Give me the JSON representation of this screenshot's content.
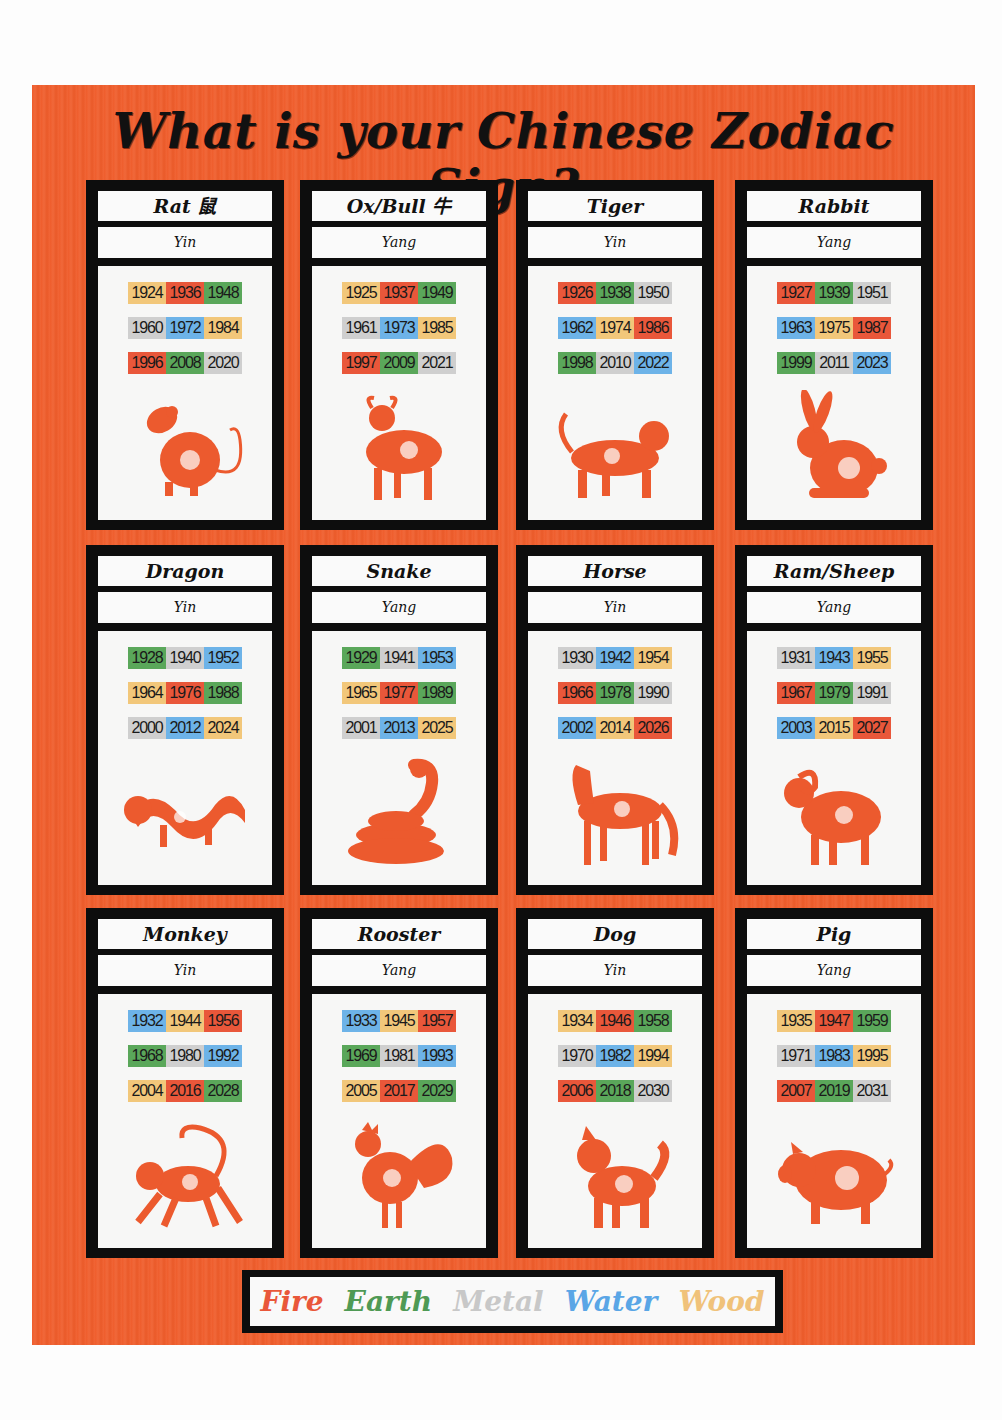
{
  "title": "What is your Chinese Zodiac Sign?",
  "colors": {
    "fire": "#e9573a",
    "earth": "#5aa75a",
    "metal": "#cfcfcf",
    "water": "#6db3e8",
    "wood": "#f2c77a",
    "poster_background": "#ef5d2c"
  },
  "legend": [
    {
      "label": "Fire",
      "element": "fire",
      "color": "#e9573a"
    },
    {
      "label": "Earth",
      "element": "earth",
      "color": "#4f9a55"
    },
    {
      "label": "Metal",
      "element": "metal",
      "color": "#c8c8c8"
    },
    {
      "label": "Water",
      "element": "water",
      "color": "#5aa6e6"
    },
    {
      "label": "Wood",
      "element": "wood",
      "color": "#f0c27a"
    }
  ],
  "signs": [
    {
      "name": "Rat 鼠",
      "polarity": "Yin",
      "icon": "rat-icon",
      "years": [
        [
          [
            "1924",
            "wood"
          ],
          [
            "1936",
            "fire"
          ],
          [
            "1948",
            "earth"
          ]
        ],
        [
          [
            "1960",
            "metal"
          ],
          [
            "1972",
            "water"
          ],
          [
            "1984",
            "wood"
          ]
        ],
        [
          [
            "1996",
            "fire"
          ],
          [
            "2008",
            "earth"
          ],
          [
            "2020",
            "metal"
          ]
        ]
      ]
    },
    {
      "name": "Ox/Bull 牛",
      "polarity": "Yang",
      "icon": "ox-icon",
      "years": [
        [
          [
            "1925",
            "wood"
          ],
          [
            "1937",
            "fire"
          ],
          [
            "1949",
            "earth"
          ]
        ],
        [
          [
            "1961",
            "metal"
          ],
          [
            "1973",
            "water"
          ],
          [
            "1985",
            "wood"
          ]
        ],
        [
          [
            "1997",
            "fire"
          ],
          [
            "2009",
            "earth"
          ],
          [
            "2021",
            "metal"
          ]
        ]
      ]
    },
    {
      "name": "Tiger",
      "polarity": "Yin",
      "icon": "tiger-icon",
      "years": [
        [
          [
            "1926",
            "fire"
          ],
          [
            "1938",
            "earth"
          ],
          [
            "1950",
            "metal"
          ]
        ],
        [
          [
            "1962",
            "water"
          ],
          [
            "1974",
            "wood"
          ],
          [
            "1986",
            "fire"
          ]
        ],
        [
          [
            "1998",
            "earth"
          ],
          [
            "2010",
            "metal"
          ],
          [
            "2022",
            "water"
          ]
        ]
      ]
    },
    {
      "name": "Rabbit",
      "polarity": "Yang",
      "icon": "rabbit-icon",
      "years": [
        [
          [
            "1927",
            "fire"
          ],
          [
            "1939",
            "earth"
          ],
          [
            "1951",
            "metal"
          ]
        ],
        [
          [
            "1963",
            "water"
          ],
          [
            "1975",
            "wood"
          ],
          [
            "1987",
            "fire"
          ]
        ],
        [
          [
            "1999",
            "earth"
          ],
          [
            "2011",
            "metal"
          ],
          [
            "2023",
            "water"
          ]
        ]
      ]
    },
    {
      "name": "Dragon",
      "polarity": "Yin",
      "icon": "dragon-icon",
      "years": [
        [
          [
            "1928",
            "earth"
          ],
          [
            "1940",
            "metal"
          ],
          [
            "1952",
            "water"
          ]
        ],
        [
          [
            "1964",
            "wood"
          ],
          [
            "1976",
            "fire"
          ],
          [
            "1988",
            "earth"
          ]
        ],
        [
          [
            "2000",
            "metal"
          ],
          [
            "2012",
            "water"
          ],
          [
            "2024",
            "wood"
          ]
        ]
      ]
    },
    {
      "name": "Snake",
      "polarity": "Yang",
      "icon": "snake-icon",
      "years": [
        [
          [
            "1929",
            "earth"
          ],
          [
            "1941",
            "metal"
          ],
          [
            "1953",
            "water"
          ]
        ],
        [
          [
            "1965",
            "wood"
          ],
          [
            "1977",
            "fire"
          ],
          [
            "1989",
            "earth"
          ]
        ],
        [
          [
            "2001",
            "metal"
          ],
          [
            "2013",
            "water"
          ],
          [
            "2025",
            "wood"
          ]
        ]
      ]
    },
    {
      "name": "Horse",
      "polarity": "Yin",
      "icon": "horse-icon",
      "years": [
        [
          [
            "1930",
            "metal"
          ],
          [
            "1942",
            "water"
          ],
          [
            "1954",
            "wood"
          ]
        ],
        [
          [
            "1966",
            "fire"
          ],
          [
            "1978",
            "earth"
          ],
          [
            "1990",
            "metal"
          ]
        ],
        [
          [
            "2002",
            "water"
          ],
          [
            "2014",
            "wood"
          ],
          [
            "2026",
            "fire"
          ]
        ]
      ]
    },
    {
      "name": "Ram/Sheep",
      "polarity": "Yang",
      "icon": "ram-icon",
      "years": [
        [
          [
            "1931",
            "metal"
          ],
          [
            "1943",
            "water"
          ],
          [
            "1955",
            "wood"
          ]
        ],
        [
          [
            "1967",
            "fire"
          ],
          [
            "1979",
            "earth"
          ],
          [
            "1991",
            "metal"
          ]
        ],
        [
          [
            "2003",
            "water"
          ],
          [
            "2015",
            "wood"
          ],
          [
            "2027",
            "fire"
          ]
        ]
      ]
    },
    {
      "name": "Monkey",
      "polarity": "Yin",
      "icon": "monkey-icon",
      "years": [
        [
          [
            "1932",
            "water"
          ],
          [
            "1944",
            "wood"
          ],
          [
            "1956",
            "fire"
          ]
        ],
        [
          [
            "1968",
            "earth"
          ],
          [
            "1980",
            "metal"
          ],
          [
            "1992",
            "water"
          ]
        ],
        [
          [
            "2004",
            "wood"
          ],
          [
            "2016",
            "fire"
          ],
          [
            "2028",
            "earth"
          ]
        ]
      ]
    },
    {
      "name": "Rooster",
      "polarity": "Yang",
      "icon": "rooster-icon",
      "years": [
        [
          [
            "1933",
            "water"
          ],
          [
            "1945",
            "wood"
          ],
          [
            "1957",
            "fire"
          ]
        ],
        [
          [
            "1969",
            "earth"
          ],
          [
            "1981",
            "metal"
          ],
          [
            "1993",
            "water"
          ]
        ],
        [
          [
            "2005",
            "wood"
          ],
          [
            "2017",
            "fire"
          ],
          [
            "2029",
            "earth"
          ]
        ]
      ]
    },
    {
      "name": "Dog",
      "polarity": "Yin",
      "icon": "dog-icon",
      "years": [
        [
          [
            "1934",
            "wood"
          ],
          [
            "1946",
            "fire"
          ],
          [
            "1958",
            "earth"
          ]
        ],
        [
          [
            "1970",
            "metal"
          ],
          [
            "1982",
            "water"
          ],
          [
            "1994",
            "wood"
          ]
        ],
        [
          [
            "2006",
            "fire"
          ],
          [
            "2018",
            "earth"
          ],
          [
            "2030",
            "metal"
          ]
        ]
      ]
    },
    {
      "name": "Pig",
      "polarity": "Yang",
      "icon": "pig-icon",
      "years": [
        [
          [
            "1935",
            "wood"
          ],
          [
            "1947",
            "fire"
          ],
          [
            "1959",
            "earth"
          ]
        ],
        [
          [
            "1971",
            "metal"
          ],
          [
            "1983",
            "water"
          ],
          [
            "1995",
            "wood"
          ]
        ],
        [
          [
            "2007",
            "fire"
          ],
          [
            "2019",
            "earth"
          ],
          [
            "2031",
            "metal"
          ]
        ]
      ]
    }
  ]
}
